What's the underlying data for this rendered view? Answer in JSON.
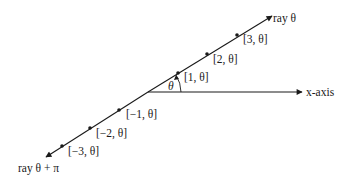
{
  "diagram": {
    "colors": {
      "line": "#1a1a1a",
      "background": "#ffffff"
    },
    "origin": {
      "x": 148,
      "y": 92
    },
    "ray_label": "ray θ",
    "opposite_ray_label": "ray θ + π",
    "axis_label": "x-axis",
    "angle_label": "θ",
    "points": [
      {
        "label": "[3, θ]",
        "x": 237,
        "y": 35
      },
      {
        "label": "[2, θ]",
        "x": 207,
        "y": 54
      },
      {
        "label": "[1, θ]",
        "x": 178,
        "y": 73
      },
      {
        "label": "[−1, θ]",
        "x": 119,
        "y": 110
      },
      {
        "label": "[−2, θ]",
        "x": 90,
        "y": 128
      },
      {
        "label": "[−3, θ]",
        "x": 62,
        "y": 146
      }
    ]
  }
}
